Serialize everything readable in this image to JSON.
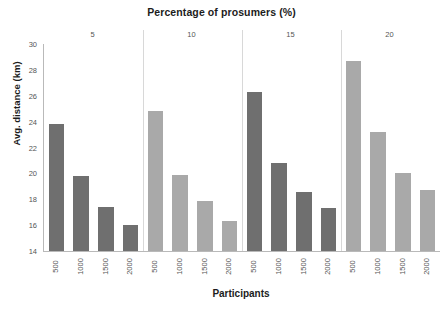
{
  "chart_data": {
    "type": "bar",
    "title": "Percentage of prosumers (%)",
    "xlabel": "Participants",
    "ylabel": "Avg. distance (km)",
    "ylim": [
      14,
      30
    ],
    "ytick_step": 2,
    "yticks": [
      "30",
      "28",
      "26",
      "24",
      "22",
      "20",
      "18",
      "16",
      "14"
    ],
    "grid": false,
    "legend": "none",
    "categories": [
      "500",
      "1000",
      "1500",
      "2000"
    ],
    "group_axis_label": "Percentage of prosumers (%)",
    "groups": [
      {
        "label": "5",
        "color": "#6f6f6f",
        "values": [
          23.8,
          19.8,
          17.4,
          16.0
        ]
      },
      {
        "label": "10",
        "color": "#a9a9a9",
        "values": [
          24.8,
          19.9,
          17.9,
          16.3
        ]
      },
      {
        "label": "15",
        "color": "#6f6f6f",
        "values": [
          26.3,
          20.8,
          18.6,
          17.3
        ]
      },
      {
        "label": "20",
        "color": "#a9a9a9",
        "values": [
          28.7,
          23.2,
          20.0,
          18.7
        ]
      }
    ],
    "bars": [
      {
        "group": "5",
        "category": "500",
        "value": 23.8,
        "color": "#6f6f6f"
      },
      {
        "group": "5",
        "category": "1000",
        "value": 19.8,
        "color": "#6f6f6f"
      },
      {
        "group": "5",
        "category": "1500",
        "value": 17.4,
        "color": "#6f6f6f"
      },
      {
        "group": "5",
        "category": "2000",
        "value": 16.0,
        "color": "#6f6f6f"
      },
      {
        "group": "10",
        "category": "500",
        "value": 24.8,
        "color": "#a9a9a9"
      },
      {
        "group": "10",
        "category": "1000",
        "value": 19.9,
        "color": "#a9a9a9"
      },
      {
        "group": "10",
        "category": "1500",
        "value": 17.9,
        "color": "#a9a9a9"
      },
      {
        "group": "10",
        "category": "2000",
        "value": 16.3,
        "color": "#a9a9a9"
      },
      {
        "group": "15",
        "category": "500",
        "value": 26.3,
        "color": "#6f6f6f"
      },
      {
        "group": "15",
        "category": "1000",
        "value": 20.8,
        "color": "#6f6f6f"
      },
      {
        "group": "15",
        "category": "1500",
        "value": 18.6,
        "color": "#6f6f6f"
      },
      {
        "group": "15",
        "category": "2000",
        "value": 17.3,
        "color": "#6f6f6f"
      },
      {
        "group": "20",
        "category": "500",
        "value": 28.7,
        "color": "#a9a9a9"
      },
      {
        "group": "20",
        "category": "1000",
        "value": 23.2,
        "color": "#a9a9a9"
      },
      {
        "group": "20",
        "category": "1500",
        "value": 20.0,
        "color": "#a9a9a9"
      },
      {
        "group": "20",
        "category": "2000",
        "value": 18.7,
        "color": "#a9a9a9"
      }
    ],
    "axis_color": "#b9b9b9",
    "separator_color": "#d8d8d8",
    "text_color": "#555555"
  }
}
